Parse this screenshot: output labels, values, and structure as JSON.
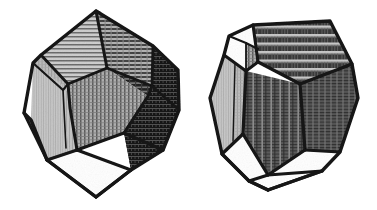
{
  "plate": {
    "background_color": "#ffffff",
    "ink_color": "#141414",
    "width": 377,
    "height": 210,
    "medium": "engraving",
    "title": "Two shaded polyhedra",
    "figure_count": 2
  },
  "figures": [
    {
      "id": "left-polyhedron",
      "name": "icosahedron",
      "label": "",
      "face_shape": "triangle",
      "edge_color": "#141414",
      "bounds": {
        "x": 18,
        "y": 8,
        "width": 165,
        "height": 194
      },
      "vertices": {
        "apex": {
          "x": 96,
          "y": 11
        },
        "left": {
          "x": 24,
          "y": 113
        },
        "bottom": {
          "x": 96,
          "y": 197
        },
        "right": {
          "x": 178,
          "y": 105
        }
      },
      "faces": [
        {
          "name": "upper-left-triangle",
          "tone": "#b0b0b0",
          "hatch": "horizontal"
        },
        {
          "name": "upper-right-triangle",
          "tone": "#9a9a9a",
          "hatch": "horizontal"
        },
        {
          "name": "left-quad",
          "tone": "#bdbdbd",
          "hatch": "vertical-fine"
        },
        {
          "name": "center-triangle",
          "tone": "#a8a8a8",
          "hatch": "vertical"
        },
        {
          "name": "right-triangle",
          "tone": "#6a6a6a",
          "hatch": "horizontal"
        },
        {
          "name": "lower-right-shadow",
          "tone": "#1e1e1e",
          "hatch": "brick"
        },
        {
          "name": "bottom-triangle",
          "tone": "#ffffff",
          "hatch": "none"
        }
      ]
    },
    {
      "id": "right-polyhedron",
      "name": "dodecahedron",
      "label": "",
      "face_shape": "pentagon",
      "edge_color": "#141414",
      "bounds": {
        "x": 206,
        "y": 16,
        "width": 155,
        "height": 176
      },
      "vertices": {
        "top_left": {
          "x": 253,
          "y": 25
        },
        "top_right": {
          "x": 330,
          "y": 21
        },
        "left": {
          "x": 210,
          "y": 98
        },
        "right": {
          "x": 358,
          "y": 98
        },
        "bottom": {
          "x": 268,
          "y": 190
        }
      },
      "faces": [
        {
          "name": "top-pentagon",
          "tone": "#4e4e4e",
          "hatch": "horizontal-banded"
        },
        {
          "name": "upper-left-pentagon",
          "tone": "#ffffff",
          "hatch": "none"
        },
        {
          "name": "left-pentagon",
          "tone": "#b5b5b5",
          "hatch": "vertical-fine"
        },
        {
          "name": "front-pentagon",
          "tone": "#6e6e6e",
          "hatch": "vertical-striped"
        },
        {
          "name": "right-pentagon",
          "tone": "#5a5a5a",
          "hatch": "vertical"
        },
        {
          "name": "bottom-pentagon",
          "tone": "#ffffff",
          "hatch": "none"
        }
      ]
    }
  ],
  "tones": {
    "white": "#ffffff",
    "pale": "#c4c4c4",
    "light": "#b5b5b5",
    "mid_light": "#a2a2a2",
    "mid": "#8a8a8a",
    "mid_dark": "#6a6a6a",
    "dark": "#4a4a4a",
    "deep": "#2a2a2a",
    "ink": "#141414"
  }
}
